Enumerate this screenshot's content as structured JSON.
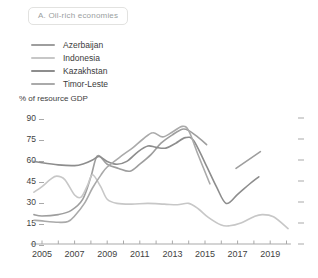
{
  "panel": {
    "title": "A. Oil-rich economies"
  },
  "legend": [
    {
      "label": "Azerbaijan",
      "color": "#9e9e9e"
    },
    {
      "label": "Indonesia",
      "color": "#c7c7c7"
    },
    {
      "label": "Kazakhstan",
      "color": "#8d8d8d"
    },
    {
      "label": "Timor-Leste",
      "color": "#aaaaaa"
    }
  ],
  "axes": {
    "y_title": "% of resource GDP",
    "axis_color": "#a9a9a9"
  },
  "chart_data": {
    "type": "line",
    "title": "A. Oil-rich economies",
    "ylabel": "% of resource GDP",
    "xlabel": "",
    "ylim": [
      0,
      90
    ],
    "yticks": [
      90,
      75,
      60,
      45,
      30,
      15,
      0
    ],
    "xlim": [
      2004.3,
      2020.7
    ],
    "xticks_minor": [
      2005,
      2006,
      2007,
      2008,
      2009,
      2010,
      2011,
      2012,
      2013,
      2014,
      2015,
      2016,
      2017,
      2018,
      2019,
      2020
    ],
    "xticks_labeled": [
      2005,
      2007,
      2009,
      2011,
      2013,
      2015,
      2017,
      2019
    ],
    "grid": false,
    "legend_position": "top-left",
    "right_axis_ticks": true,
    "series": [
      {
        "name": "Azerbaijan",
        "color": "#9e9e9e",
        "segments": [
          [
            [
              2004.5,
              21
            ],
            [
              2005,
              20
            ],
            [
              2006,
              21
            ],
            [
              2006.8,
              24
            ],
            [
              2007.5,
              32
            ],
            [
              2008,
              48
            ],
            [
              2008.4,
              63
            ],
            [
              2009,
              57
            ],
            [
              2009.7,
              54
            ],
            [
              2010.4,
              52
            ],
            [
              2011,
              57
            ],
            [
              2011.7,
              64
            ],
            [
              2012.3,
              72
            ],
            [
              2013,
              78
            ],
            [
              2013.6,
              82
            ],
            [
              2014,
              81
            ],
            [
              2014.6,
              76
            ],
            [
              2015.1,
              71
            ]
          ],
          [
            [
              2016.9,
              54
            ],
            [
              2018.4,
              66
            ]
          ]
        ]
      },
      {
        "name": "Indonesia",
        "color": "#c7c7c7",
        "segments": [
          [
            [
              2004.5,
              37
            ],
            [
              2005,
              41
            ],
            [
              2005.5,
              46
            ],
            [
              2005.9,
              48.5
            ],
            [
              2006.4,
              46
            ],
            [
              2007,
              35
            ],
            [
              2007.4,
              33.5
            ],
            [
              2007.8,
              42
            ],
            [
              2008.1,
              49.5
            ],
            [
              2008.6,
              41
            ],
            [
              2009,
              32
            ],
            [
              2009.6,
              29
            ],
            [
              2010.5,
              28.5
            ],
            [
              2011.5,
              29
            ],
            [
              2012.5,
              28.5
            ],
            [
              2013.3,
              28
            ],
            [
              2014,
              29
            ],
            [
              2014.6,
              25
            ],
            [
              2015.2,
              19
            ],
            [
              2016,
              13.5
            ],
            [
              2016.5,
              13
            ],
            [
              2017.2,
              15
            ],
            [
              2018,
              19.5
            ],
            [
              2018.5,
              21
            ],
            [
              2019.2,
              19.5
            ],
            [
              2020.1,
              11
            ]
          ]
        ]
      },
      {
        "name": "Kazakhstan",
        "color": "#8d8d8d",
        "segments": [
          [
            [
              2004.5,
              59
            ],
            [
              2005,
              58
            ],
            [
              2006,
              56.5
            ],
            [
              2007,
              56
            ],
            [
              2007.6,
              57.5
            ],
            [
              2008.1,
              60
            ],
            [
              2008.5,
              62.5
            ],
            [
              2009,
              59
            ],
            [
              2009.6,
              57
            ],
            [
              2010.2,
              59
            ],
            [
              2010.9,
              66
            ],
            [
              2011.5,
              70
            ],
            [
              2012,
              69
            ],
            [
              2012.6,
              68.5
            ],
            [
              2013.2,
              72
            ],
            [
              2013.8,
              76
            ],
            [
              2014.3,
              74
            ],
            [
              2015,
              58
            ],
            [
              2015.7,
              41
            ],
            [
              2016.3,
              29
            ],
            [
              2017,
              35.5
            ],
            [
              2017.7,
              42.5
            ],
            [
              2018.3,
              48
            ]
          ]
        ]
      },
      {
        "name": "Timor-Leste",
        "color": "#aaaaaa",
        "segments": [
          [
            [
              2004.5,
              17
            ],
            [
              2005,
              16.5
            ],
            [
              2006,
              15.5
            ],
            [
              2006.6,
              16
            ],
            [
              2007,
              20
            ],
            [
              2007.6,
              29
            ],
            [
              2008.1,
              40
            ],
            [
              2008.6,
              49
            ],
            [
              2009,
              55
            ],
            [
              2010,
              64
            ],
            [
              2010.6,
              69
            ],
            [
              2011.2,
              75
            ],
            [
              2011.8,
              79.5
            ],
            [
              2012.4,
              76.5
            ],
            [
              2013,
              80
            ],
            [
              2013.6,
              84
            ],
            [
              2014,
              81
            ],
            [
              2014.6,
              63
            ],
            [
              2015.3,
              43
            ]
          ]
        ]
      }
    ]
  }
}
